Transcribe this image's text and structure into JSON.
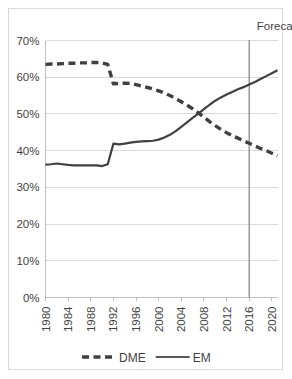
{
  "chart_data": {
    "type": "line",
    "title": "",
    "xlabel": "",
    "ylabel": "",
    "ylim": [
      0,
      0.7
    ],
    "xlim": [
      1980,
      2021
    ],
    "grid": true,
    "legend_position": "bottom",
    "y_tick_labels": [
      "0%",
      "10%",
      "20%",
      "30%",
      "40%",
      "50%",
      "60%",
      "70%"
    ],
    "y_tick_values": [
      0,
      10,
      20,
      30,
      40,
      50,
      60,
      70
    ],
    "x_tick_labels": [
      "1980",
      "1984",
      "1988",
      "1992",
      "1996",
      "2000",
      "2004",
      "2008",
      "2012",
      "2016",
      "2020"
    ],
    "x_tick_values": [
      1980,
      1984,
      1988,
      1992,
      1996,
      2000,
      2004,
      2008,
      2012,
      2016,
      2020
    ],
    "annotations": [
      {
        "text": "Forecast",
        "x": 2016,
        "type": "vertical-line-label"
      }
    ],
    "x": [
      1980,
      1981,
      1982,
      1983,
      1984,
      1985,
      1986,
      1987,
      1988,
      1989,
      1990,
      1991,
      1992,
      1993,
      1994,
      1995,
      1996,
      1997,
      1998,
      1999,
      2000,
      2001,
      2002,
      2003,
      2004,
      2005,
      2006,
      2007,
      2008,
      2009,
      2010,
      2011,
      2012,
      2013,
      2014,
      2015,
      2016,
      2017,
      2018,
      2019,
      2020,
      2021
    ],
    "series": [
      {
        "name": "DME",
        "style": "dashed",
        "color": "#404040",
        "values": [
          63.5,
          63.6,
          63.6,
          63.7,
          63.8,
          63.8,
          63.9,
          63.9,
          64.0,
          64.0,
          63.9,
          63.5,
          58.2,
          58.3,
          58.4,
          58.3,
          58.0,
          57.6,
          57.2,
          56.8,
          56.3,
          55.7,
          55.0,
          54.2,
          53.3,
          52.4,
          51.4,
          50.3,
          49.1,
          47.9,
          46.8,
          45.8,
          44.9,
          44.1,
          43.4,
          42.7,
          42.0,
          41.3,
          40.6,
          40.0,
          39.3,
          38.6
        ]
      },
      {
        "name": "EM",
        "style": "solid",
        "color": "#595959",
        "values": [
          36.2,
          36.3,
          36.5,
          36.3,
          36.1,
          36.0,
          36.0,
          36.0,
          36.0,
          36.0,
          35.8,
          36.3,
          41.9,
          41.7,
          41.9,
          42.2,
          42.4,
          42.5,
          42.6,
          42.7,
          43.0,
          43.6,
          44.3,
          45.3,
          46.5,
          47.7,
          48.9,
          50.1,
          51.3,
          52.5,
          53.6,
          54.5,
          55.3,
          56.0,
          56.7,
          57.3,
          58.0,
          58.7,
          59.5,
          60.3,
          61.1,
          61.9
        ]
      }
    ]
  },
  "legend": {
    "items": [
      {
        "label": "DME",
        "style": "dashed"
      },
      {
        "label": "EM",
        "style": "solid"
      }
    ]
  },
  "forecast": {
    "label": "Forecast",
    "year": 2016
  },
  "colors": {
    "grid": "#d9d9d9",
    "axis": "#bfbfbf",
    "line": "#404040",
    "text": "#3f3f3f",
    "forecast_line": "#7f7f7f",
    "background": "#ffffff"
  }
}
